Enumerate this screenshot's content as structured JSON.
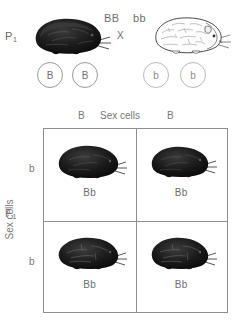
{
  "diagram": {
    "parent_generation": {
      "label": "P",
      "label_subscript": "1",
      "cross_symbol": "X",
      "parents": [
        {
          "genotype": "BB",
          "phenotype": "black",
          "organism_icon": "black-guinea-pig",
          "gametes": [
            "B",
            "B"
          ]
        },
        {
          "genotype": "bb",
          "phenotype": "white",
          "organism_icon": "white-guinea-pig",
          "gametes": [
            "b",
            "b"
          ]
        }
      ]
    },
    "offspring_generation": {
      "label": "F",
      "label_subscript": "1"
    },
    "punnett": {
      "top_axis_title": "Sex cells",
      "left_axis_title": "Sex cells",
      "column_headers": [
        "B",
        "B"
      ],
      "row_headers": [
        "b",
        "b"
      ],
      "cells": [
        [
          {
            "genotype": "Bb",
            "organism_icon": "black-guinea-pig"
          },
          {
            "genotype": "Bb",
            "organism_icon": "black-guinea-pig"
          }
        ],
        [
          {
            "genotype": "Bb",
            "organism_icon": "black-guinea-pig"
          },
          {
            "genotype": "Bb",
            "organism_icon": "black-guinea-pig"
          }
        ]
      ]
    },
    "colors": {
      "line": "#8e8e8e",
      "text": "#6e6e6e",
      "background": "#ffffff",
      "dominant_fill": "#1a1a1a",
      "recessive_fill": "#fcfcfc"
    }
  }
}
